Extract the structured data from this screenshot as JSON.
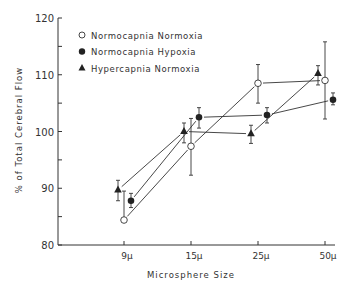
{
  "chart_data": {
    "type": "line",
    "title": "",
    "xlabel": "Microsphere Size",
    "ylabel": "% of Total Cerebral Flow",
    "categories": [
      "9μ",
      "15μ",
      "25μ",
      "50μ"
    ],
    "ylim": [
      80,
      120
    ],
    "yticks": [
      80,
      90,
      100,
      110,
      120
    ],
    "grid": false,
    "legend_position": "upper-left",
    "series": [
      {
        "name": "Normocapnia Normoxia",
        "marker": "open-circle",
        "values": [
          84.4,
          97.4,
          108.5,
          109.0
        ],
        "err_low": [
          84.4,
          92.3,
          105.0,
          102.2
        ],
        "err_high": [
          89.5,
          102.3,
          111.8,
          115.8
        ]
      },
      {
        "name": "Normocapnia Hypoxia",
        "marker": "filled-circle",
        "values": [
          87.8,
          102.5,
          102.9,
          105.6
        ],
        "err_low": [
          86.6,
          100.6,
          101.5,
          104.7
        ],
        "err_high": [
          89.1,
          104.2,
          104.2,
          106.8
        ]
      },
      {
        "name": "Hypercapnia Normoxia",
        "marker": "filled-triangle",
        "values": [
          89.7,
          100.0,
          99.6,
          110.2
        ],
        "err_low": [
          87.8,
          98.0,
          97.9,
          108.2
        ],
        "err_high": [
          91.4,
          101.5,
          101.1,
          111.6
        ]
      }
    ]
  }
}
